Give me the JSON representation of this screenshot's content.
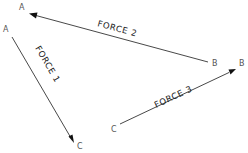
{
  "diagram": {
    "type": "force-vector-triangle",
    "forces": [
      {
        "name": "FORCE 1",
        "label": "FORCE 1",
        "from_point": "A",
        "to_point": "C",
        "from_label": "A",
        "to_label": "C"
      },
      {
        "name": "FORCE 2",
        "label": "FORCE 2",
        "from_point": "B",
        "to_point": "A",
        "from_label": "B",
        "to_label": "A"
      },
      {
        "name": "FORCE 3",
        "label": "FORCE 3",
        "from_point": "C",
        "to_point": "B",
        "from_label": "C",
        "to_label": "B"
      }
    ],
    "colors": {
      "line": "#333333",
      "arrowhead": "#111111",
      "text": "#222222",
      "point_label": "#555555",
      "background": "#ffffff"
    }
  }
}
